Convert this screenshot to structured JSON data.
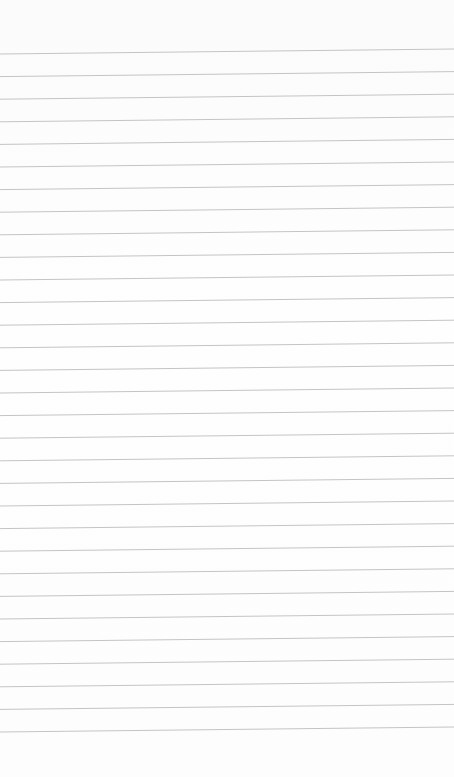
{
  "paper": {
    "type": "lined-paper",
    "background_color": "#fdfdfd",
    "line_color": "#c4c4c4",
    "line_count": 31,
    "first_line_y_left": 54,
    "first_line_y_right": 49,
    "line_spacing": 22.6
  }
}
